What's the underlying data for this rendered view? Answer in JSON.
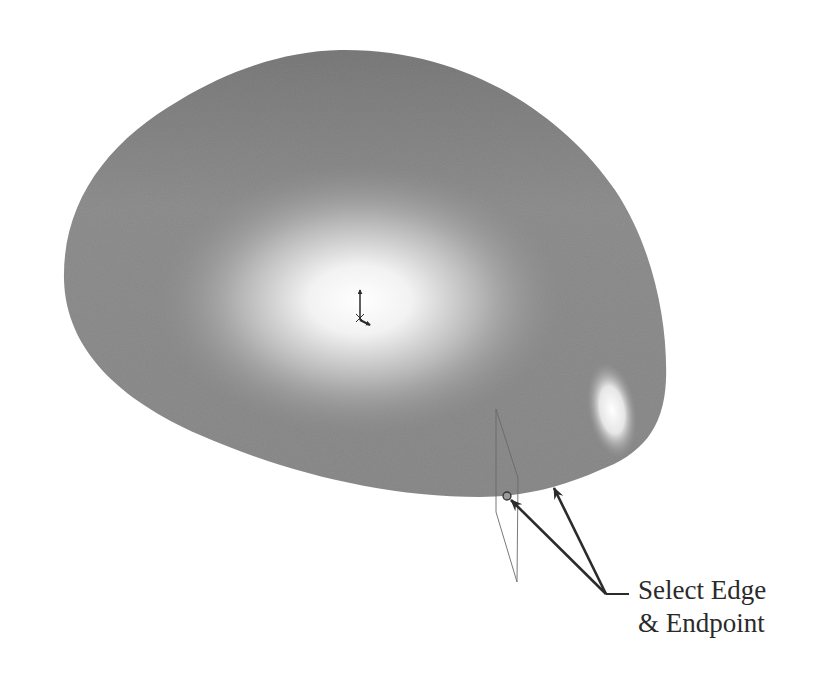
{
  "figure": {
    "type": "cad-surface-illustration",
    "object": "domed surface",
    "colors": {
      "surface_base": "#8f8f8f",
      "surface_dark": "#7a7a7a",
      "highlight": "#ffffff",
      "leader": "#2b2b2b",
      "plane_outline": "#6a6a6a",
      "background": "#ffffff"
    }
  },
  "callout": {
    "line1": "Select Edge",
    "line2": "& Endpoint"
  },
  "icons": {
    "origin_triad": "coordinate-triad-icon",
    "endpoint_marker": "endpoint-circle-icon",
    "reference_plane": "reference-plane"
  }
}
